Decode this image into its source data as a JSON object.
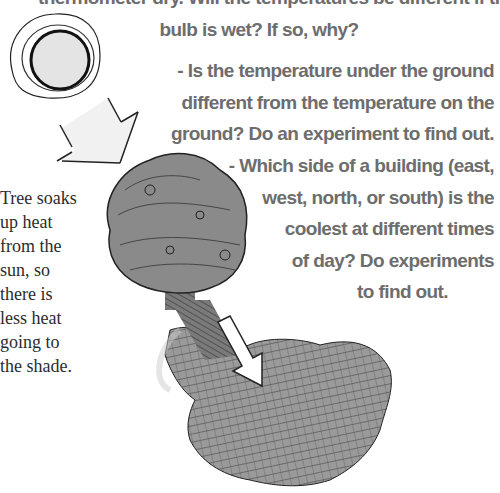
{
  "questions": [
    {
      "lines": [
        "thermometer dry. Will the temperatures be different if the thermometer",
        "bulb is wet? If so, why?"
      ]
    },
    {
      "bullet": "-",
      "lines": [
        "- Is the temperature under the ground",
        "different from the temperature on the",
        "ground? Do an experiment to find out."
      ]
    },
    {
      "bullet": "-",
      "lines": [
        "- Which side of a building (east,",
        "west, north, or south) is the",
        "coolest at different times",
        "of day? Do experiments",
        "to find out."
      ]
    }
  ],
  "caption": {
    "lines": [
      "Tree soaks",
      "up heat",
      "from the",
      "sun, so",
      "there is",
      "less heat",
      "going to",
      "the shade."
    ]
  },
  "illustration": {
    "elements": [
      "sun",
      "sunlight-arrow",
      "tree",
      "shade-arrow",
      "shade"
    ],
    "colors": {
      "text": "#6d6d6d",
      "caption": "#2c2c2c",
      "sun_fill": "#e6e6e6",
      "tree_fill": "#8a8a8a",
      "shade_fill": "#9a9a9a"
    }
  }
}
